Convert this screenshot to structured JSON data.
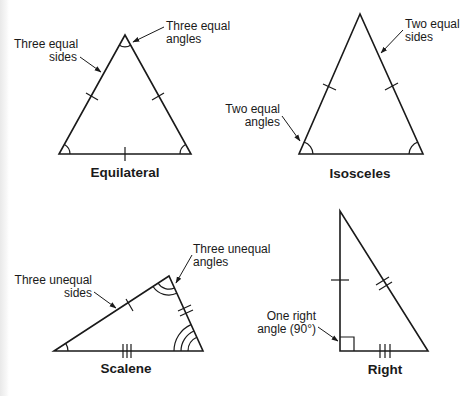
{
  "figure": {
    "line_color": "#1a1a1a",
    "background": "#ffffff"
  },
  "triangles": {
    "equilateral": {
      "title": "Equilateral",
      "callouts": {
        "sides": "Three equal\nsides",
        "angles": "Three equal\nangles"
      },
      "tick_marks_per_side": [
        1,
        1,
        1
      ],
      "angle_arcs_per_corner": [
        1,
        1,
        1
      ]
    },
    "isosceles": {
      "title": "Isosceles",
      "callouts": {
        "sides": "Two equal\nsides",
        "angles": "Two equal\nangles"
      },
      "tick_marks_per_side": [
        1,
        1,
        0
      ],
      "angle_arcs_per_corner": [
        1,
        1,
        0
      ]
    },
    "scalene": {
      "title": "Scalene",
      "callouts": {
        "sides": "Three unequal\nsides",
        "angles": "Three unequal\nangles"
      },
      "tick_marks_per_side": [
        1,
        2,
        3
      ],
      "angle_arcs_per_corner": [
        1,
        2,
        3
      ]
    },
    "right": {
      "title": "Right",
      "callouts": {
        "angle": "One right\nangle (90°)"
      },
      "tick_marks_per_side": [
        1,
        2,
        3
      ],
      "right_angle_marker": true
    }
  }
}
